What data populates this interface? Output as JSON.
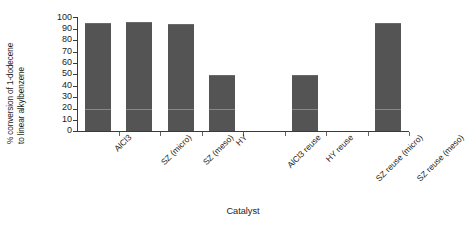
{
  "chart_data": {
    "type": "bar",
    "title": "",
    "xlabel": "Catalyst",
    "ylabel_line1": "% conversion of 1-dodecene",
    "ylabel_line2": "to linear alkylbenzene",
    "categories": [
      "AlCl3",
      "SZ (micro)",
      "SZ (meso)",
      "HY",
      "AlCl3 reuse",
      "HY reuse",
      "SZ reuse (micro)",
      "SZ reuse (meso)"
    ],
    "values": [
      95,
      96,
      94,
      49,
      0,
      49,
      0,
      95
    ],
    "ylim": [
      0,
      100
    ],
    "yticks": [
      100,
      90,
      80,
      70,
      60,
      50,
      40,
      30,
      20,
      10,
      0
    ],
    "ytick_labels": [
      "100",
      "90",
      "80",
      "70",
      "60",
      "50",
      "40",
      "30",
      "20",
      "10",
      "0"
    ],
    "grid": false,
    "legend": "none",
    "bar_color": "#545454",
    "axis_color": "#3a3a3a",
    "background": "#ffffff"
  }
}
